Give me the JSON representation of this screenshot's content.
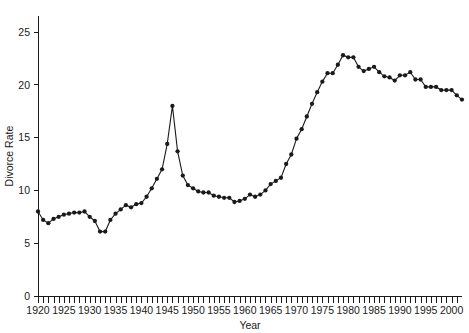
{
  "chart_data": {
    "type": "line",
    "title": "",
    "subtitle": "",
    "xlabel": "Year",
    "ylabel": "Divorce Rate",
    "xlim": [
      1920,
      2003
    ],
    "ylim": [
      0,
      26.5
    ],
    "yticks": [
      0,
      5,
      10,
      15,
      20,
      25
    ],
    "ytick_labels": [
      "0",
      "5",
      "10",
      "15",
      "20",
      "25"
    ],
    "xticks": [
      1920,
      1925,
      1930,
      1935,
      1940,
      1945,
      1950,
      1955,
      1960,
      1965,
      1970,
      1975,
      1980,
      1985,
      1990,
      1995,
      2000
    ],
    "xtick_labels": [
      "1920",
      "1925",
      "1930",
      "1935",
      "1940",
      "1945",
      "1950",
      "1955",
      "1960",
      "1965",
      "1970",
      "1975",
      "1980",
      "1985",
      "1990",
      "1995",
      "2000"
    ],
    "xtick_minor_step": 1,
    "grid": false,
    "legend": false,
    "legend_position": "none",
    "marker": "filled-circle",
    "marker_size": 4.2,
    "line_color": "#1a1a1a",
    "marker_color": "#1a1a1a",
    "x": [
      1920,
      1921,
      1922,
      1923,
      1924,
      1925,
      1926,
      1927,
      1928,
      1929,
      1930,
      1931,
      1932,
      1933,
      1934,
      1935,
      1936,
      1937,
      1938,
      1939,
      1940,
      1941,
      1942,
      1943,
      1944,
      1945,
      1946,
      1947,
      1948,
      1949,
      1950,
      1951,
      1952,
      1953,
      1954,
      1955,
      1956,
      1957,
      1958,
      1959,
      1960,
      1961,
      1962,
      1963,
      1964,
      1965,
      1966,
      1967,
      1968,
      1969,
      1970,
      1971,
      1972,
      1973,
      1974,
      1975,
      1976,
      1977,
      1978,
      1979,
      1980,
      1981,
      1982,
      1983,
      1984,
      1985,
      1986,
      1987,
      1988,
      1989,
      1990,
      1991,
      1992,
      1993,
      1994,
      1995,
      1996,
      1997,
      1998,
      1999,
      2000,
      2001,
      2002
    ],
    "y": [
      8.0,
      7.2,
      6.9,
      7.3,
      7.5,
      7.7,
      7.8,
      7.9,
      7.9,
      8.0,
      7.5,
      7.1,
      6.1,
      6.1,
      7.2,
      7.8,
      8.2,
      8.6,
      8.4,
      8.7,
      8.8,
      9.4,
      10.2,
      11.1,
      12.0,
      14.4,
      18.0,
      13.7,
      11.4,
      10.5,
      10.2,
      9.9,
      9.8,
      9.8,
      9.5,
      9.4,
      9.3,
      9.3,
      8.9,
      9.0,
      9.2,
      9.6,
      9.4,
      9.6,
      10.0,
      10.6,
      10.9,
      11.2,
      12.5,
      13.4,
      14.9,
      15.8,
      17.0,
      18.2,
      19.3,
      20.3,
      21.1,
      21.1,
      21.9,
      22.8,
      22.6,
      22.6,
      21.7,
      21.3,
      21.5,
      21.7,
      21.2,
      20.8,
      20.7,
      20.4,
      20.9,
      20.9,
      21.2,
      20.5,
      20.5,
      19.8,
      19.8,
      19.8,
      19.5,
      19.5,
      19.5,
      19.0,
      18.6
    ],
    "series": [
      {
        "name": "Divorce Rate",
        "values": [
          8.0,
          7.2,
          6.9,
          7.3,
          7.5,
          7.7,
          7.8,
          7.9,
          7.9,
          8.0,
          7.5,
          7.1,
          6.1,
          6.1,
          7.2,
          7.8,
          8.2,
          8.6,
          8.4,
          8.7,
          8.8,
          9.4,
          10.2,
          11.1,
          12.0,
          14.4,
          18.0,
          13.7,
          11.4,
          10.5,
          10.2,
          9.9,
          9.8,
          9.8,
          9.5,
          9.4,
          9.3,
          9.3,
          8.9,
          9.0,
          9.2,
          9.6,
          9.4,
          9.6,
          10.0,
          10.6,
          10.9,
          11.2,
          12.5,
          13.4,
          14.9,
          15.8,
          17.0,
          18.2,
          19.3,
          20.3,
          21.1,
          21.1,
          21.9,
          22.8,
          22.6,
          22.6,
          21.7,
          21.3,
          21.5,
          21.7,
          21.2,
          20.8,
          20.7,
          20.4,
          20.9,
          20.9,
          21.2,
          20.5,
          20.5,
          19.8,
          19.8,
          19.8,
          19.5,
          19.5,
          19.5,
          19.0,
          18.6
        ]
      }
    ],
    "annotations": []
  },
  "geometry": {
    "plot_left": 38,
    "plot_right": 462,
    "plot_top": 20,
    "plot_bottom": 296,
    "year_min": 1920,
    "year_max": 2002,
    "px_per_year": 5.17,
    "y_zero_px": 296,
    "px_per_unit": 10.56
  }
}
